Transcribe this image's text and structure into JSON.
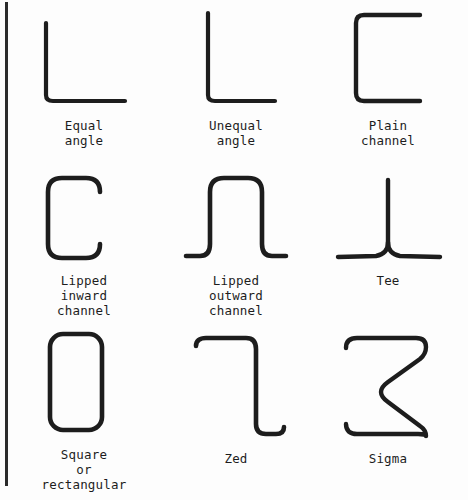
{
  "figure": {
    "clipped_top_caption": "",
    "background_color": "#fdfdfd",
    "line_color": "#1d1d1d",
    "border_color": "#2b2b2b"
  },
  "sections": [
    {
      "id": "equal-angle",
      "label": "Equal\nangle",
      "shape": "L-angle with equal legs"
    },
    {
      "id": "unequal-angle",
      "label": "Unequal\nangle",
      "shape": "L-angle with one longer leg"
    },
    {
      "id": "plain-channel",
      "label": "Plain\nchannel",
      "shape": "Open C channel without lips"
    },
    {
      "id": "lipped-inward-channel",
      "label": "Lipped\ninward\nchannel",
      "shape": "C channel with inward return lips"
    },
    {
      "id": "lipped-outward-channel",
      "label": "Lipped\noutward\nchannel",
      "shape": "Top-hat channel with outward flanges"
    },
    {
      "id": "tee",
      "label": "Tee",
      "shape": "Inverted T with stem and flange"
    },
    {
      "id": "square-or-rectangular",
      "label": "Square\nor\nrectangular",
      "shape": "Closed hollow section with rounded corners"
    },
    {
      "id": "zed",
      "label": "Zed",
      "shape": "Z section with lips at both ends"
    },
    {
      "id": "sigma",
      "label": "Sigma",
      "shape": "Sigma section with central stiffener"
    }
  ]
}
